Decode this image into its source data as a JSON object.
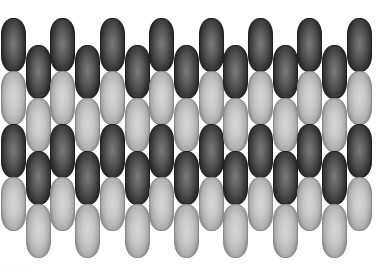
{
  "figure": {
    "columns": 15,
    "ovals_per_column": 4,
    "pattern": [
      "dark",
      "light",
      "dark",
      "light"
    ],
    "odd_column_top_px": 18,
    "even_column_top_px": 45,
    "column_pitch_px": 24.7,
    "oval_width_px": 25,
    "oval_height_px": 54,
    "colors": {
      "dark_center": "#7a7a7a",
      "dark_edge": "#252525",
      "light_center": "#d6d6d6",
      "light_edge": "#8e8e8e",
      "background": "#ffffff"
    }
  },
  "watermark": {
    "text": "· · · · ·"
  }
}
